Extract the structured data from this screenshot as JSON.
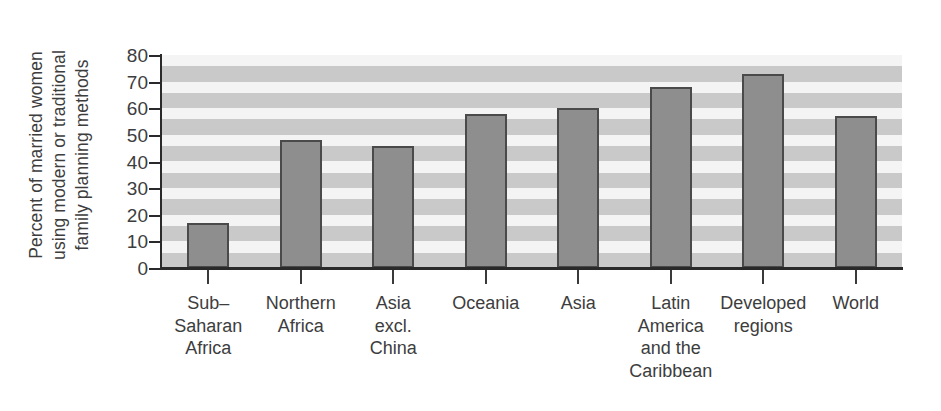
{
  "chart_data": {
    "type": "bar",
    "title": "",
    "xlabel": "",
    "ylabel": "Percent of married women using modern or traditional family planning methods",
    "ylabel_lines": [
      "Percent of married women",
      "using modern or traditional",
      "family planning methods"
    ],
    "ylim": [
      0,
      80
    ],
    "yticks": [
      0,
      10,
      20,
      30,
      40,
      50,
      60,
      70,
      80
    ],
    "ytick_labels": [
      "0",
      "10",
      "20",
      "30",
      "40",
      "50",
      "60",
      "70",
      "80"
    ],
    "grid": "horizontal-bands",
    "legend": "none",
    "categories": [
      "Sub–\nSaharan\nAfrica",
      "Northern\nAfrica",
      "Asia\nexcl.\nChina",
      "Oceania",
      "Asia",
      "Latin\nAmerica\nand the\nCaribbean",
      "Developed\nregions",
      "World"
    ],
    "category_labels_flat": [
      "Sub–Saharan Africa",
      "Northern Africa",
      "Asia excl. China",
      "Oceania",
      "Asia",
      "Latin America and the Caribbean",
      "Developed regions",
      "World"
    ],
    "values": [
      17,
      48,
      46,
      58,
      60,
      68,
      73,
      57
    ],
    "bar_fill_color": "#8e8e8e",
    "bar_edge_color": "#4a4a4a",
    "band_light_color": "#f4f4f4",
    "band_dark_color": "#c9c9c9",
    "axis_color": "#2a2a2a",
    "text_color": "#3d3d3d",
    "background_color": "#ffffff"
  }
}
